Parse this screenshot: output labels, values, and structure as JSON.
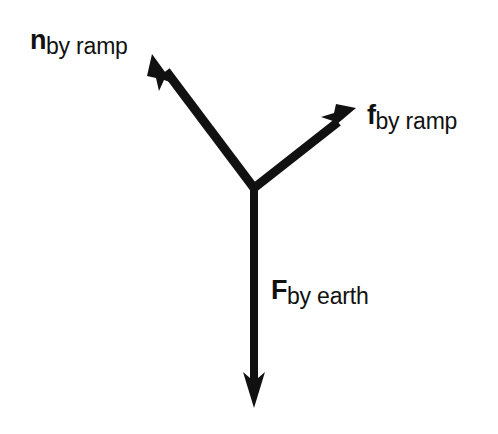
{
  "diagram": {
    "type": "free-body-diagram",
    "background_color": "#ffffff",
    "ink_color": "#111111",
    "origin": {
      "x": 254,
      "y": 188
    },
    "forces": [
      {
        "key": "normal",
        "symbol": "n",
        "subscript": "by ramp",
        "direction": "up-left",
        "tip": {
          "x": 152,
          "y": 54
        },
        "angle_deg": 127,
        "label_position": {
          "x": 30,
          "y": 27
        }
      },
      {
        "key": "friction",
        "symbol": "f",
        "subscript": "by ramp",
        "direction": "up-right",
        "tip": {
          "x": 356,
          "y": 108
        },
        "angle_deg": 39,
        "label_position": {
          "x": 367,
          "y": 102
        }
      },
      {
        "key": "gravity",
        "symbol": "F",
        "subscript": "by earth",
        "direction": "down",
        "tip": {
          "x": 254,
          "y": 408
        },
        "angle_deg": -90,
        "label_position": {
          "x": 271,
          "y": 277
        }
      }
    ]
  }
}
